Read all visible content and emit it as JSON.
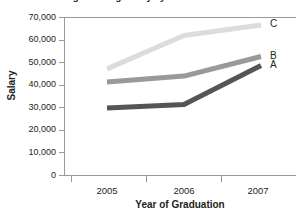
{
  "chart_data": {
    "type": "line",
    "title": "Average Starting Salary by Year of Graduation",
    "xlabel": "Year of Graduation",
    "ylabel": "Salary",
    "categories": [
      "2005",
      "2006",
      "2007"
    ],
    "x": [
      2005,
      2006,
      2007
    ],
    "ylim": [
      0,
      70000
    ],
    "yticks": [
      0,
      10000,
      20000,
      30000,
      40000,
      50000,
      60000,
      70000
    ],
    "ytick_labels": [
      "0",
      "10,000",
      "20,000",
      "30,000",
      "40,000",
      "50,000",
      "60,000",
      "70,000"
    ],
    "grid": false,
    "legend_position": "right-inline",
    "series": [
      {
        "name": "A",
        "values": [
          29700,
          31200,
          48500
        ],
        "color": "#555555"
      },
      {
        "name": "B",
        "values": [
          41200,
          43800,
          52500
        ],
        "color": "#999999"
      },
      {
        "name": "C",
        "values": [
          47000,
          61800,
          66500
        ],
        "color": "#dcdcdc"
      }
    ]
  },
  "axes": {
    "y_title": "Salary",
    "x_title": "Year of Graduation",
    "y_labels": [
      "70,000",
      "60,000",
      "50,000",
      "40,000",
      "30,000",
      "20,000",
      "10,000",
      "0"
    ],
    "x_labels": [
      "2005",
      "2006",
      "2007"
    ]
  },
  "series_labels": {
    "c": "C",
    "b": "B",
    "a": "A"
  },
  "colors": {
    "series_a": "#555555",
    "series_b": "#999999",
    "series_c": "#dcdcdc",
    "axis": "#9a9a9a",
    "text": "#231f20"
  }
}
